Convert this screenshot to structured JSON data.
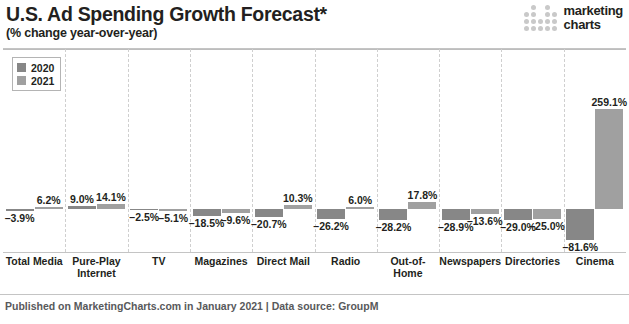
{
  "header": {
    "title": "U.S. Ad Spending Growth Forecast*",
    "subtitle": "(% change year-over-year)",
    "brand_line1": "marketing",
    "brand_line2": "charts"
  },
  "footer": {
    "text": "Published on MarketingCharts.com in January 2021 | Data source: GroupM"
  },
  "legend": {
    "items": [
      {
        "label": "2020",
        "color": "#878787"
      },
      {
        "label": "2021",
        "color": "#a0a0a0"
      }
    ]
  },
  "chart_data": {
    "type": "bar",
    "title": "U.S. Ad Spending Growth Forecast*",
    "subtitle": "(% change year-over-year)",
    "xlabel": "",
    "ylabel": "% change year-over-year",
    "ylim": [
      -81.6,
      259.1
    ],
    "grid": true,
    "legend_position": "top-left",
    "categories": [
      "Total Media",
      "Pure-Play Internet",
      "TV",
      "Magazines",
      "Direct Mail",
      "Radio",
      "Out-of-Home",
      "Newspapers",
      "Directories",
      "Cinema"
    ],
    "series": [
      {
        "name": "2020",
        "color": "#878787",
        "values": [
          -3.9,
          9.0,
          -2.5,
          -18.5,
          -20.7,
          -26.2,
          -28.2,
          -28.9,
          -29.0,
          -81.6
        ],
        "labels": [
          "–3.9%",
          "9.0%",
          "–2.5%",
          "–18.5%",
          "–20.7%",
          "–26.2%",
          "–28.2%",
          "–28.9%",
          "–29.0%",
          "–81.6%"
        ]
      },
      {
        "name": "2021",
        "color": "#a0a0a0",
        "values": [
          6.2,
          14.1,
          -5.1,
          -9.6,
          10.3,
          6.0,
          17.8,
          -13.6,
          -25.0,
          259.1
        ],
        "labels": [
          "6.2%",
          "14.1%",
          "–5.1%",
          "–9.6%",
          "10.3%",
          "6.0%",
          "17.8%",
          "–13.6%",
          "–25.0%",
          "259.1%"
        ]
      }
    ]
  }
}
